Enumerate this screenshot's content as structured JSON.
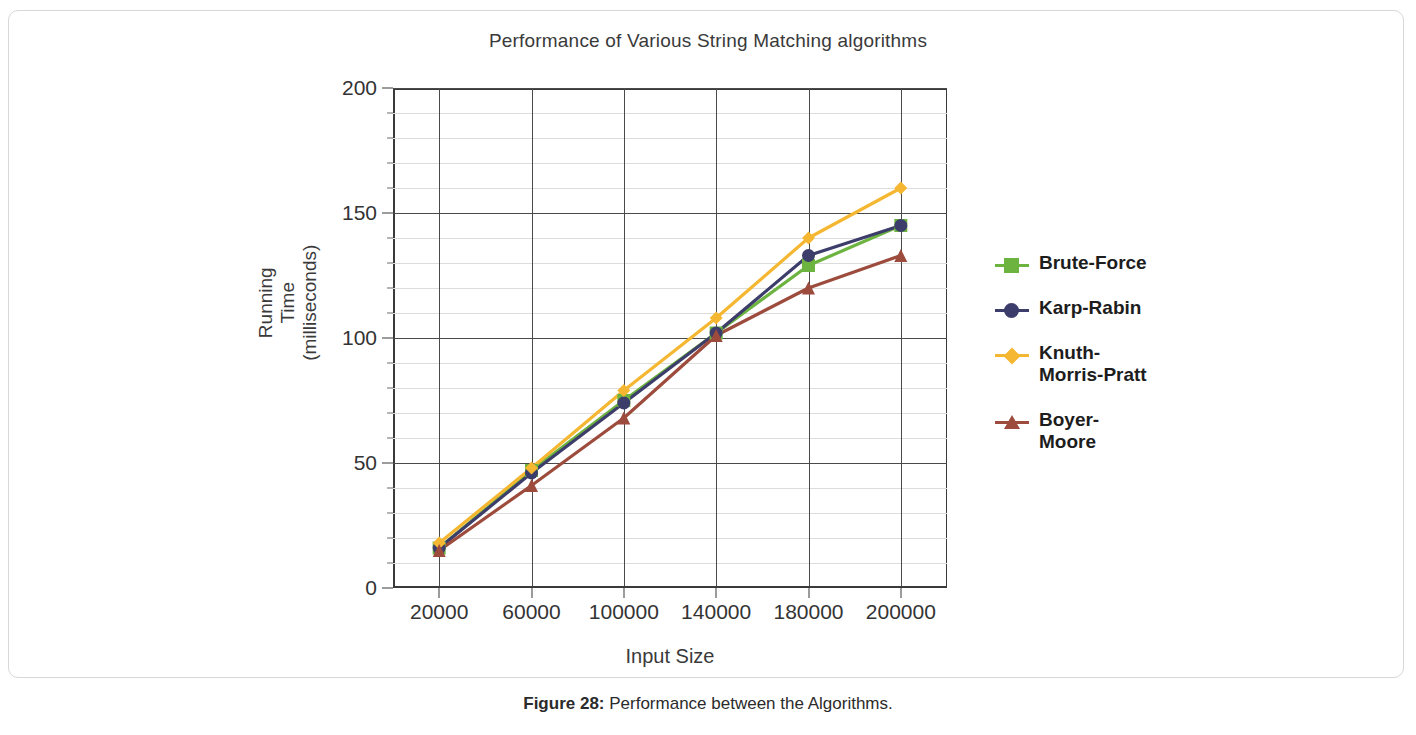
{
  "figure": {
    "caption_label": "Figure 28:",
    "caption_text": " Performance between the Algorithms."
  },
  "chart_data": {
    "type": "line",
    "title": "Performance of Various String Matching algorithms",
    "xlabel": "Input Size",
    "ylabel": "Running\nTime\n(milliseconds)",
    "categories": [
      "20000",
      "60000",
      "100000",
      "140000",
      "180000",
      "200000"
    ],
    "ylim": [
      0,
      200
    ],
    "yticks": [
      0,
      50,
      100,
      150,
      200
    ],
    "ytick_labels": [
      "0",
      "50",
      "100",
      "150",
      "200"
    ],
    "yminor_step": 10,
    "grid": true,
    "legend_position": "right",
    "series": [
      {
        "name": "Brute-Force",
        "color": "#6cb33f",
        "marker": "square",
        "values": [
          16,
          47,
          75,
          102,
          129,
          145
        ]
      },
      {
        "name": "Karp-Rabin",
        "color": "#3d3d6b",
        "marker": "circle",
        "values": [
          16,
          46,
          74,
          102,
          133,
          145
        ]
      },
      {
        "name": "Knuth-\nMorris-Pratt",
        "color": "#f5b731",
        "marker": "diamond",
        "values": [
          18,
          48,
          79,
          108,
          140,
          160
        ]
      },
      {
        "name": "Boyer-\nMoore",
        "color": "#9c4b3c",
        "marker": "triangle",
        "values": [
          15,
          41,
          68,
          101,
          120,
          133
        ]
      }
    ]
  }
}
